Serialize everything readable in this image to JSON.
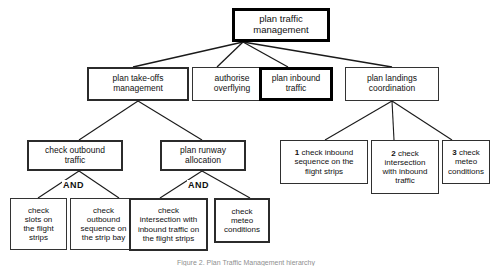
{
  "diagram": {
    "caption": "Figure 2.  Plan Traffic Management hierarchy",
    "colors": {
      "box_border": "#333333",
      "highlight_border": "#000000",
      "edge": "#1a1a1a",
      "background": "#ffffff",
      "text": "#111111"
    },
    "operators": {
      "and_left": "AND",
      "and_right": "AND"
    },
    "nodes": {
      "root": "plan traffic\nmanagement",
      "l2_takeoffs": "plan take-offs\nmanagement",
      "l2_overflying": "authorise\noverflying",
      "l2_inbound": "plan inbound\ntraffic",
      "l2_landings": "plan landings\ncoordination",
      "l3_outbound": "check outbound\ntraffic",
      "l3_runway": "plan runway\nallocation",
      "l3_num1_num": "1",
      "l3_num1_text": " check inbound\nsequence on the\nflight strips",
      "l3_num2_num": "2",
      "l3_num2_text": " check\nintersection\nwith inbound\ntraffic",
      "l3_num3_num": "3",
      "l3_num3_text": " check\nmeteo\nconditions",
      "l4_slots": "check\nslots on\nthe flight\nstrips",
      "l4_outbound_seq": "check\noutbound\nsequence on\nthe strip bay",
      "l4_intersection": "check\nintersection with\ninbound traffic on\nthe flight strips",
      "l4_meteo": "check\nmeteo\nconditions"
    }
  }
}
